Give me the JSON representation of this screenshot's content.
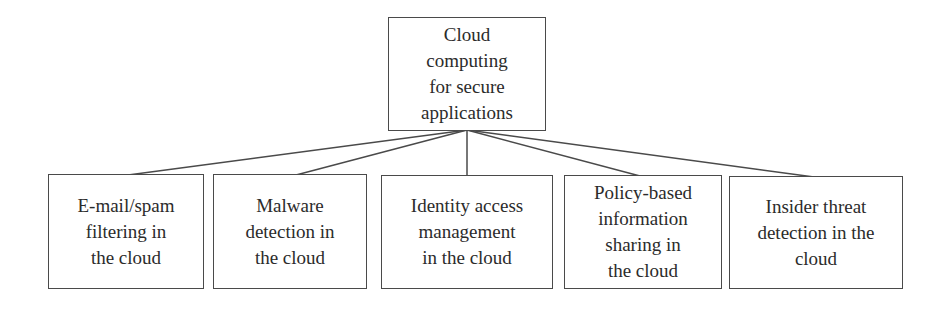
{
  "root": {
    "label": "Cloud\ncomputing\nfor secure\napplications"
  },
  "children": [
    {
      "label": "E-mail/spam\nfiltering in\nthe cloud"
    },
    {
      "label": "Malware\ndetection in\nthe cloud"
    },
    {
      "label": "Identity access\nmanagement\nin the cloud"
    },
    {
      "label": "Policy-based\ninformation\nsharing in\nthe cloud"
    },
    {
      "label": "Insider threat\ndetection in the\ncloud"
    }
  ],
  "colors": {
    "line": "#4a4a4a",
    "text": "#2b2b2b",
    "background": "#ffffff"
  }
}
